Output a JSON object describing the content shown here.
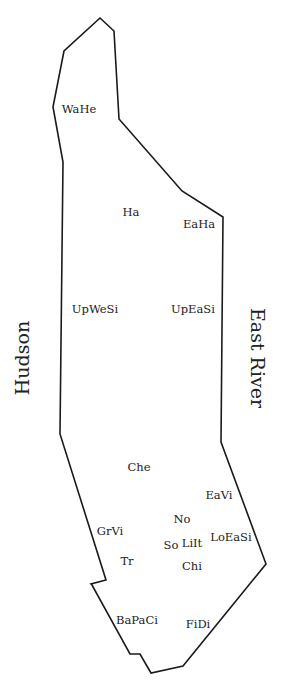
{
  "map": {
    "rivers": {
      "west": "Hudson",
      "east": "East River"
    },
    "neighborhoods": [
      {
        "abbr": "WaHe",
        "x": 79,
        "y": 109
      },
      {
        "abbr": "Ha",
        "x": 131,
        "y": 212
      },
      {
        "abbr": "EaHa",
        "x": 199,
        "y": 224
      },
      {
        "abbr": "UpWeSi",
        "x": 95,
        "y": 309
      },
      {
        "abbr": "UpEaSi",
        "x": 193,
        "y": 309
      },
      {
        "abbr": "Che",
        "x": 139,
        "y": 467
      },
      {
        "abbr": "EaVi",
        "x": 219,
        "y": 495
      },
      {
        "abbr": "No",
        "x": 182,
        "y": 519
      },
      {
        "abbr": "GrVi",
        "x": 110,
        "y": 531
      },
      {
        "abbr": "LoEaSi",
        "x": 231,
        "y": 537
      },
      {
        "abbr": "So",
        "x": 171,
        "y": 545
      },
      {
        "abbr": "LiIt",
        "x": 192,
        "y": 543
      },
      {
        "abbr": "Tr",
        "x": 127,
        "y": 561
      },
      {
        "abbr": "Chi",
        "x": 192,
        "y": 566
      },
      {
        "abbr": "BaPaCi",
        "x": 137,
        "y": 620
      },
      {
        "abbr": "FiDi",
        "x": 198,
        "y": 624
      }
    ],
    "outline_points": "100,18 114,31 119,119 182,191 223,217 221,442 266,564 183,666 151,673 140,654 130,654 92,585 91,584 106,580 60,434 63,162 53,107 64,51",
    "colors": {
      "outline": "#1a1a1a",
      "text": "#222222",
      "background": "#ffffff"
    }
  }
}
